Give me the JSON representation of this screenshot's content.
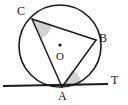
{
  "figure": {
    "name": "circle-tangent-inscribed-angle-diagram",
    "background_color": "#ffffff",
    "stroke_color": "#1a1a1a",
    "shade_color": "#b9b9b9",
    "labels": {
      "center": "O",
      "point_a": "A",
      "point_b": "B",
      "point_c": "C",
      "point_t": "T"
    },
    "points": {
      "center": {
        "x": 60,
        "y": 46
      },
      "a": {
        "x": 62,
        "y": 87
      },
      "b": {
        "x": 96,
        "y": 40
      },
      "c": {
        "x": 32,
        "y": 19
      },
      "t_line_start": {
        "x": 3,
        "y": 86
      },
      "t_line_end": {
        "x": 108,
        "y": 84
      }
    },
    "circle": {
      "cx": 60,
      "cy": 46,
      "r": 41
    },
    "chords": [
      "CB",
      "CA",
      "AB"
    ],
    "shaded_angles": [
      "angle-ACB-at-C",
      "angle-BAT-at-A"
    ],
    "label_positions": {
      "c": {
        "x": 17,
        "y": 5
      },
      "b": {
        "x": 99,
        "y": 32
      },
      "o": {
        "x": 56,
        "y": 51
      },
      "a": {
        "x": 58,
        "y": 90
      },
      "t": {
        "x": 111,
        "y": 74
      }
    }
  }
}
